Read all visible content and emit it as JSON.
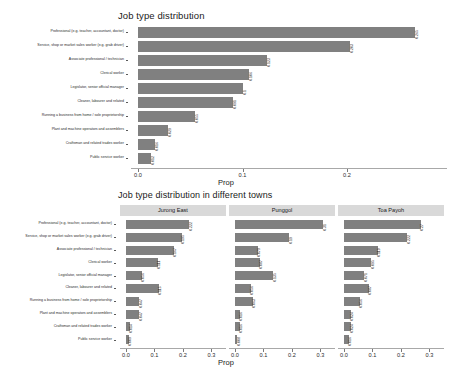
{
  "chart_data": [
    {
      "type": "bar",
      "orientation": "horizontal",
      "title": "Job type distribution",
      "xlabel": "Prop",
      "ylabel": "",
      "xlim": [
        0,
        0.28
      ],
      "xticks": [
        0.0,
        0.1,
        0.2
      ],
      "xticklabels": [
        "0.0",
        "0.1",
        "0.2"
      ],
      "grid": false,
      "bar_color": "#808080",
      "categories": [
        "Professional (e.g. teacher, accountant, doctor)",
        "Service, shop or market sales worker (e.g. grab driver)",
        "Associate professional / technician",
        "Clerical worker",
        "Legislator, senior official manager",
        "Cleaner, labourer and related",
        "Running a business from home / sole proprietorship",
        "Plant and machine operators and assemblers",
        "Craftsman and related trades worker",
        "Public service worker"
      ],
      "values": [
        0.265,
        0.203,
        0.123,
        0.106,
        0.1,
        0.091,
        0.055,
        0.029,
        0.016,
        0.012
      ],
      "value_labels": [
        "0.265",
        "0.203",
        "0.123",
        "0.106",
        "0.1",
        "0.091",
        "0.055",
        "0.029",
        "0.016",
        "0.012"
      ]
    },
    {
      "type": "bar",
      "orientation": "horizontal",
      "faceted": true,
      "title": "Job type distribution in different towns",
      "xlabel": "Prop",
      "ylabel": "",
      "xlim": [
        0,
        0.33
      ],
      "xticks": [
        0.0,
        0.1,
        0.2,
        0.3
      ],
      "xticklabels": [
        "0.0",
        "0.1",
        "0.2",
        "0.3"
      ],
      "grid": false,
      "bar_color": "#808080",
      "legend_position": "none",
      "categories": [
        "Professional (e.g. teacher, accountant, doctor)",
        "Service, shop or market sales worker (e.g. grab driver)",
        "Associate professional / technician",
        "Clerical worker",
        "Legislator, senior official manager",
        "Cleaner, labourer and related",
        "Running a business from home / sole proprietorship",
        "Plant and machine operators and assemblers",
        "Craftsman and related trades worker",
        "Public service worker"
      ],
      "series": [
        {
          "name": "Jurong East",
          "values": [
            0.222,
            0.195,
            0.167,
            0.111,
            0.056,
            0.115,
            0.047,
            0.047,
            0.014,
            0.009
          ],
          "value_labels": [
            "0.222",
            "0.195",
            "0.167",
            "0.111",
            "0.056",
            "0.115",
            "0.047",
            "0.047",
            "0.014",
            "0.009"
          ]
        },
        {
          "name": "Punggol",
          "values": [
            0.31,
            0.19,
            0.079,
            0.087,
            0.135,
            0.056,
            0.063,
            0.016,
            0.016,
            0.008
          ],
          "value_labels": [
            "0.31",
            "0.19",
            "0.079",
            "0.087",
            "0.135",
            "0.056",
            "0.063",
            "0.016",
            "0.016",
            "0.008"
          ]
        },
        {
          "name": "Toa Payoh",
          "values": [
            0.27,
            0.222,
            0.119,
            0.095,
            0.071,
            0.087,
            0.056,
            0.024,
            0.024,
            0.016
          ],
          "value_labels": [
            "0.27",
            "0.222",
            "0.119",
            "0.095",
            "0.071",
            "0.087",
            "0.056",
            "0.024",
            "0.024",
            "0.016"
          ]
        }
      ]
    }
  ]
}
